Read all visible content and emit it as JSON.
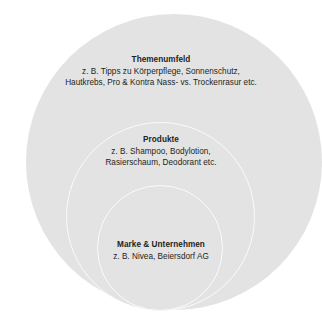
{
  "diagram": {
    "type": "nested-circles",
    "background_color": "#ffffff",
    "circle_fill_color": "#e3e3e3",
    "circle_stroke_color": "#fbfbfb",
    "layers": [
      {
        "id": "themenumfeld",
        "title": "Themenumfeld",
        "lines": [
          "z. B. Tipps zu Körperpflege, Sonnenschutz,",
          "Hautkrebs, Pro & Kontra Nass- vs. Trockenrasur etc."
        ]
      },
      {
        "id": "produkte",
        "title": "Produkte",
        "lines": [
          "z. B. Shampoo, Bodylotion,",
          "Rasierschaum, Deodorant etc."
        ]
      },
      {
        "id": "marke",
        "title": "Marke & Unternehmen",
        "lines": [
          "z. B. Nivea, Beiersdorf AG"
        ]
      }
    ]
  }
}
